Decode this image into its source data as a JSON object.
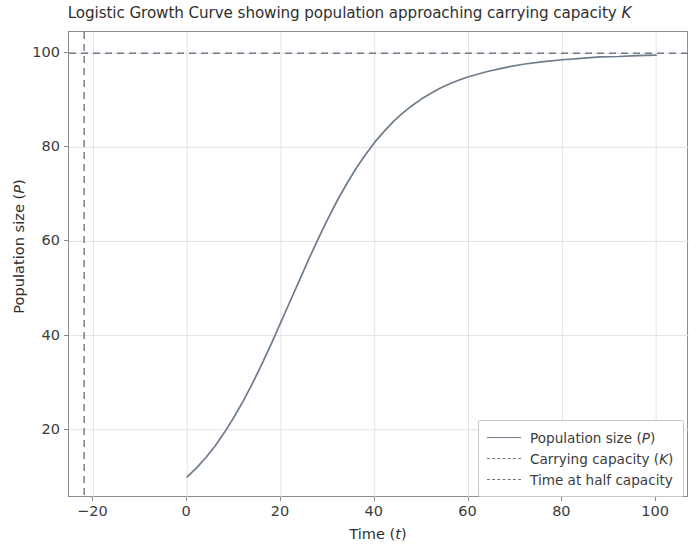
{
  "chart_data": {
    "type": "line",
    "title": "Logistic Growth Curve showing population approaching carrying capacity K",
    "title_plain": "Logistic Growth Curve showing population approaching carrying capacity",
    "title_math": "K",
    "xlabel_plain": "Time (",
    "xlabel_math": "t",
    "xlabel_close": ")",
    "ylabel_plain": "Population size (",
    "ylabel_math": "P",
    "ylabel_close": ")",
    "xlim": [
      -25.2,
      107.0
    ],
    "ylim": [
      5.5,
      104.5
    ],
    "xticks": [
      -20,
      0,
      20,
      40,
      60,
      80,
      100
    ],
    "xtick_labels": [
      "−20",
      "0",
      "20",
      "40",
      "60",
      "80",
      "100"
    ],
    "yticks": [
      20,
      40,
      60,
      80,
      100
    ],
    "ytick_labels": [
      "20",
      "40",
      "60",
      "80",
      "100"
    ],
    "grid": true,
    "legend_position": "lower right",
    "carrying_capacity": 100,
    "initial_population": 10,
    "growth_rate": 0.1,
    "time_at_half_capacity": -21.97,
    "curve_color": "#6e7b8b",
    "grid_color": "#e2e2e2",
    "axis_color": "#8c8c8c",
    "background_color": "#ffffff",
    "series": [
      {
        "name": "Population size (P)",
        "style": "solid",
        "x": [
          0,
          2,
          4,
          6,
          8,
          10,
          12,
          14,
          16,
          18,
          20,
          22,
          24,
          26,
          28,
          30,
          32,
          34,
          36,
          38,
          40,
          42,
          44,
          46,
          48,
          50,
          52,
          54,
          56,
          58,
          60,
          64,
          68,
          72,
          76,
          80,
          84,
          88,
          92,
          96,
          100
        ],
        "y": [
          10.0,
          11.9,
          14.1,
          16.6,
          19.5,
          22.7,
          26.2,
          30.0,
          34.1,
          38.4,
          42.9,
          47.4,
          51.9,
          56.4,
          60.7,
          64.8,
          68.7,
          72.2,
          75.5,
          78.4,
          81.1,
          83.4,
          85.5,
          87.3,
          88.9,
          90.3,
          91.5,
          92.6,
          93.5,
          94.3,
          95.0,
          96.1,
          97.0,
          97.7,
          98.2,
          98.6,
          98.9,
          99.2,
          99.3,
          99.5,
          99.6
        ]
      },
      {
        "name": "Carrying capacity (K)",
        "style": "dashed",
        "type": "hline",
        "value": 100
      },
      {
        "name": "Time at half capacity",
        "style": "dashed",
        "type": "vline",
        "value": -21.97
      }
    ],
    "legend": [
      {
        "label_plain": "Population size (",
        "label_math": "P",
        "label_close": ")",
        "style": "solid"
      },
      {
        "label_plain": "Carrying capacity (",
        "label_math": "K",
        "label_close": ")",
        "style": "dashed"
      },
      {
        "label_plain": "Time at half capacity",
        "label_math": "",
        "label_close": "",
        "style": "dashed"
      }
    ]
  }
}
